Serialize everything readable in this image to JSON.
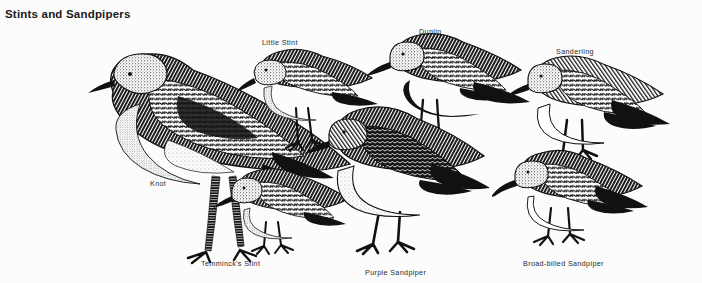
{
  "plate": {
    "title": "Stints and Sandpipers",
    "background_color": "#fcfcfc",
    "ink_color": "#111111",
    "style": "pen-and-ink engraving",
    "width": 702,
    "height": 283
  },
  "birds": [
    {
      "id": "knot",
      "label": "Knot",
      "label_x": 150,
      "label_y": 179,
      "facing": "left",
      "size": "large",
      "notes": "largest bird, centre-left, dark mottled upperparts, long legs"
    },
    {
      "id": "little-stint",
      "label": "Little Stint",
      "label_x": 262,
      "label_y": 38,
      "facing": "left",
      "size": "small",
      "notes": "small, head lowered, upper row left of centre"
    },
    {
      "id": "dunlin",
      "label": "Dunlin",
      "label_x": 419,
      "label_y": 27,
      "facing": "left",
      "size": "medium",
      "notes": "black belly patch, long decurved bill, top row centre"
    },
    {
      "id": "sanderling",
      "label": "Sanderling",
      "label_x": 556,
      "label_y": 47,
      "facing": "left",
      "size": "medium",
      "notes": "pale white underparts, short straight bill, top right"
    },
    {
      "id": "temmincks-stint",
      "label": "Temminck's Stint",
      "label_x": 201,
      "label_y": 259,
      "facing": "left",
      "size": "small",
      "notes": "small, lower left, short legs"
    },
    {
      "id": "purple-sandpiper",
      "label": "Purple Sandpiper",
      "label_x": 365,
      "label_y": 268,
      "facing": "left",
      "size": "medium-large",
      "notes": "stocky, dark, heavily spotted white belly, centre bottom"
    },
    {
      "id": "broad-billed-sandpiper",
      "label": "Broad-billed Sandpiper",
      "label_x": 523,
      "label_y": 259,
      "facing": "left",
      "size": "small-medium",
      "notes": "drooping bill tip, bottom right"
    }
  ]
}
